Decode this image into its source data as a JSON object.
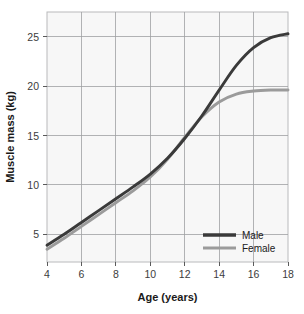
{
  "chart_data": {
    "type": "line",
    "title": "",
    "xlabel": "Age (years)",
    "ylabel": "Muscle mass (kg)",
    "xlim": [
      4,
      18
    ],
    "ylim": [
      2.2,
      27.5
    ],
    "xticks": [
      4,
      6,
      8,
      10,
      12,
      14,
      16,
      18
    ],
    "xtick_labels": [
      "4",
      "6",
      "8",
      "10",
      "12",
      "14",
      "16",
      "18"
    ],
    "yticks": [
      5,
      10,
      15,
      20,
      25
    ],
    "ytick_labels": [
      "5",
      "10",
      "15",
      "20",
      "25"
    ],
    "grid": true,
    "legend_position": "bottom-right",
    "x": [
      4,
      5,
      6,
      7,
      8,
      9,
      10,
      11,
      12,
      13,
      14,
      15,
      16,
      17,
      18
    ],
    "series": [
      {
        "name": "Male",
        "color": "#3a3a3a",
        "values": [
          3.9,
          5.0,
          6.2,
          7.4,
          8.6,
          9.8,
          11.1,
          12.7,
          14.7,
          17.0,
          19.6,
          22.1,
          23.9,
          24.9,
          25.3
        ]
      },
      {
        "name": "Female",
        "color": "#9b9b9b",
        "values": [
          3.5,
          4.6,
          5.8,
          7.0,
          8.2,
          9.4,
          10.8,
          12.6,
          14.8,
          16.9,
          18.4,
          19.2,
          19.5,
          19.6,
          19.6
        ]
      }
    ]
  },
  "legend": {
    "entries": [
      {
        "label": "Male",
        "swatch": "male-line-swatch"
      },
      {
        "label": "Female",
        "swatch": "female-line-swatch"
      }
    ]
  },
  "colors": {
    "male": "#3a3a3a",
    "female": "#9b9b9b",
    "plot_background": "#f7f7f7",
    "grid": "#9fa0a2",
    "plot_border": "#b9babc",
    "text": "#1a1a1a"
  }
}
